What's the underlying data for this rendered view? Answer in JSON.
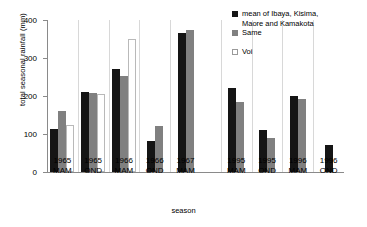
{
  "chart_data": {
    "type": "bar",
    "title": "",
    "xlabel": "season",
    "ylabel": "total seasonal rainfall (mm)",
    "ylim": [
      0,
      400
    ],
    "yticks": [
      0,
      100,
      200,
      300,
      400
    ],
    "grid": false,
    "legend_position": "top-right",
    "categories": [
      "1965 MAM",
      "1965 OND",
      "1966 MAM",
      "1966 OND",
      "1967 MAM",
      "1995 MAM",
      "1995 OND",
      "1996 MAM",
      "1996 OND"
    ],
    "category_lines": [
      [
        "1965",
        "MAM"
      ],
      [
        "1965",
        "OND"
      ],
      [
        "1966",
        "MAM"
      ],
      [
        "1966",
        "OND"
      ],
      [
        "1967",
        "MAM"
      ],
      [
        "1995",
        "MAM"
      ],
      [
        "1995",
        "OND"
      ],
      [
        "1996",
        "MAM"
      ],
      [
        "1996",
        "OND"
      ]
    ],
    "series": [
      {
        "name": "mean of Ibaya, Kisima, Maore and Kamakota",
        "color": "#151515",
        "values": [
          113,
          210,
          270,
          82,
          365,
          220,
          110,
          200,
          70
        ]
      },
      {
        "name": "Same",
        "color": "#808080",
        "values": [
          160,
          208,
          253,
          120,
          375,
          185,
          90,
          192,
          null
        ]
      },
      {
        "name": "Voi",
        "color": "#ffffff",
        "values": [
          125,
          205,
          350,
          null,
          null,
          null,
          null,
          null,
          null
        ]
      }
    ]
  },
  "legend": {
    "entries": [
      {
        "label_line1": "mean of Ibaya, Kisima,",
        "label_line2": "Maore and Kamakota",
        "swatch": "black"
      },
      {
        "label_line1": "Same",
        "label_line2": "",
        "swatch": "gray"
      },
      {
        "label_line1": "Voi",
        "label_line2": "",
        "swatch": "white"
      }
    ]
  },
  "axes": {
    "y_title": "total seasonal rainfall (mm)",
    "x_title": "season",
    "y_tick_400": "400",
    "y_tick_300": "300",
    "y_tick_200": "200",
    "y_tick_100": "100",
    "y_tick_0": "0"
  }
}
